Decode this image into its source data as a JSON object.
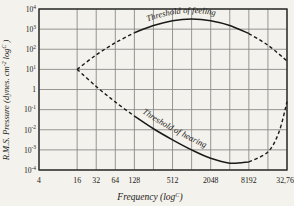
{
  "chart_data": {
    "type": "line",
    "title": "",
    "xlabel": "Frequency (log",
    "xlabel_sup": "C",
    "xlabel_tail": ")",
    "ylabel": "R.M.S. Pressure (dynes. cm",
    "ylabel_sup": "-2",
    "ylabel_mid": " log",
    "ylabel_sup2": "C",
    "ylabel_tail": " )",
    "x_tick_labels": [
      "4",
      "16",
      "32",
      "64",
      "128",
      "512",
      "2048",
      "8192",
      "32,768"
    ],
    "x_tick_values": [
      4,
      16,
      32,
      64,
      128,
      512,
      2048,
      8192,
      32768
    ],
    "x_gridlines": [
      4,
      16,
      32,
      64,
      128,
      256,
      512,
      1024,
      2048,
      4096,
      8192,
      16384,
      32768
    ],
    "y_tick_labels": [
      "10",
      "10",
      "10",
      "10",
      "1",
      "10",
      "10",
      "10",
      "10"
    ],
    "y_tick_sups": [
      "4",
      "3",
      "2",
      "1",
      "",
      "-1",
      "-2",
      "-3",
      "-4"
    ],
    "y_tick_exponents": [
      4,
      3,
      2,
      1,
      0,
      -1,
      -2,
      -3,
      -4
    ],
    "xlim": [
      4,
      32768
    ],
    "ylim": [
      -4,
      4
    ],
    "grid": true,
    "legend_position": "none",
    "series": [
      {
        "name": "Threshold of feeling",
        "style": "solid",
        "label_text": "Threshold of feeling",
        "points": [
          [
            16,
            1.0
          ],
          [
            32,
            1.72
          ],
          [
            64,
            2.32
          ],
          [
            128,
            2.82
          ],
          [
            256,
            3.18
          ],
          [
            512,
            3.42
          ],
          [
            1024,
            3.5
          ],
          [
            2048,
            3.42
          ],
          [
            4096,
            3.18
          ],
          [
            8192,
            2.78
          ],
          [
            16384,
            2.2
          ],
          [
            32768,
            1.42
          ]
        ]
      },
      {
        "name": "Threshold of hearing",
        "style": "solid",
        "label_text": "Threshold of hearing",
        "points": [
          [
            16,
            1.0
          ],
          [
            32,
            0.15
          ],
          [
            64,
            -0.62
          ],
          [
            128,
            -1.32
          ],
          [
            256,
            -1.95
          ],
          [
            512,
            -2.5
          ],
          [
            1024,
            -3.0
          ],
          [
            2048,
            -3.42
          ],
          [
            4096,
            -3.66
          ],
          [
            8192,
            -3.6
          ],
          [
            16384,
            -3.1
          ],
          [
            24576,
            -2.1
          ],
          [
            32768,
            -0.6
          ]
        ]
      }
    ],
    "dashed_segments": [
      {
        "name": "upper-left-dashed",
        "from": [
          16,
          1.0
        ],
        "to": [
          128,
          2.82
        ]
      },
      {
        "name": "upper-right-dashed",
        "from": [
          8192,
          2.78
        ],
        "to": [
          32768,
          1.42
        ]
      },
      {
        "name": "lower-left-dashed",
        "from": [
          16,
          1.0
        ],
        "to": [
          128,
          -1.32
        ]
      },
      {
        "name": "lower-right-dashed",
        "from": [
          8192,
          -3.6
        ],
        "to": [
          32768,
          1.42
        ]
      }
    ],
    "colors": {
      "background": "#f4f2ec",
      "grid": "#8a8a88",
      "axis": "#2a2a28",
      "curve": "#1a1a18"
    }
  }
}
